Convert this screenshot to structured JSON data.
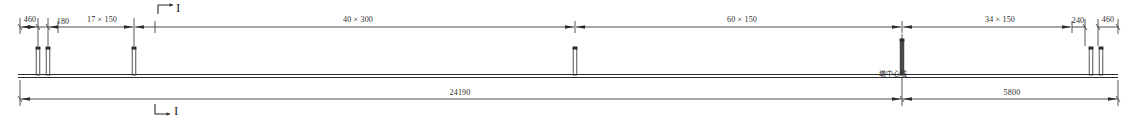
{
  "drawing": {
    "title": "Bridge deck elevation layout",
    "line_color": "#2b2b2b",
    "background": "#ffffff"
  },
  "top_dimensions": [
    {
      "id": "d-460-left",
      "label": "460",
      "x": 30,
      "y": 17
    },
    {
      "id": "d-180",
      "label": "180",
      "x": 62,
      "y": 19
    },
    {
      "id": "d-17x150",
      "label": "17 × 150",
      "x": 101,
      "y": 17
    },
    {
      "id": "d-40x300",
      "label": "40 × 300",
      "x": 358,
      "y": 17
    },
    {
      "id": "d-60x150",
      "label": "60 × 150",
      "x": 742,
      "y": 17
    },
    {
      "id": "d-34x150",
      "label": "34 × 150",
      "x": 1000,
      "y": 17
    },
    {
      "id": "d-240",
      "label": "240",
      "x": 1078,
      "y": 18
    },
    {
      "id": "d-460-right",
      "label": "460",
      "x": 1107,
      "y": 17
    }
  ],
  "bottom_dimensions": [
    {
      "id": "d-24190",
      "label": "24190",
      "x": 460,
      "y": 89
    },
    {
      "id": "d-5800",
      "label": "5800",
      "x": 1012,
      "y": 89
    }
  ],
  "annotations": [
    {
      "id": "pier-centerline",
      "label": "墩中心线",
      "x": 893,
      "y": 72
    }
  ],
  "section_marks": [
    {
      "id": "section-top",
      "label": "I",
      "x": 176,
      "y": 2,
      "arrow": "right"
    },
    {
      "id": "section-bottom",
      "label": "I",
      "x": 177,
      "y": 104,
      "arrow": "down-right"
    }
  ],
  "posts": {
    "label": "guardrail-post",
    "positions": [
      38,
      48,
      134,
      575,
      902,
      1091,
      1101
    ],
    "tall_positions": [
      902
    ]
  },
  "deck": {
    "label": "deck-line",
    "y": 76,
    "x1": 18,
    "x2": 1118
  },
  "dimension_lines": {
    "top": {
      "y": 26,
      "x1": 20,
      "x2": 1120
    },
    "bottom": {
      "y": 98,
      "x1": 20,
      "x2": 1118
    }
  },
  "tick_positions_top": [
    20,
    38,
    48,
    58,
    134,
    155,
    575,
    902,
    952,
    1072,
    1085,
    1098,
    1120
  ],
  "tick_positions_bottom": [
    20,
    902,
    1118
  ]
}
